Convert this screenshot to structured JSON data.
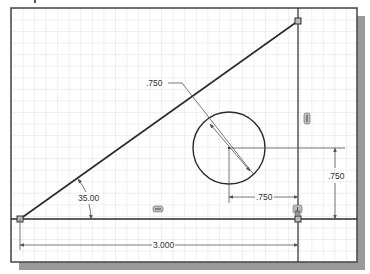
{
  "sketch": {
    "frame": {
      "x": 11,
      "y": 8,
      "width": 346,
      "height": 254,
      "border_color": "#444444",
      "shadow_color": "#9a9a9a",
      "grid_color": "#d6d6d6",
      "grid_spacing": 11.5
    },
    "geometry": {
      "triangle": {
        "p1": [
          20,
          219
        ],
        "p2": [
          298,
          21
        ],
        "p3": [
          298,
          219
        ]
      },
      "circle": {
        "cx": 229,
        "cy": 148,
        "r": 36
      },
      "line_color": "#2a2a2a"
    },
    "dimensions": {
      "circle_diameter": {
        "label": ".750"
      },
      "horizontal_offset": {
        "label": ".750"
      },
      "vertical_offset": {
        "label": ".750"
      },
      "base_length": {
        "label": "3.000"
      },
      "angle": {
        "label": "35.00"
      }
    },
    "constraints": {
      "horizontal_glyph": "horizontal-constraint",
      "vertical_glyph": "vertical-constraint",
      "perpendicular_glyph": "perpendicular-constraint"
    }
  }
}
